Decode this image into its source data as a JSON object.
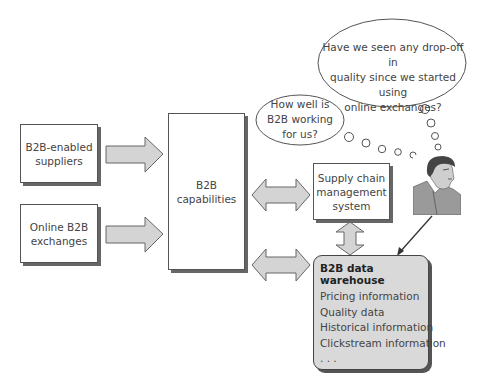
{
  "diagram": {
    "sources": [
      {
        "label": "B2B-enabled\nsuppliers"
      },
      {
        "label": "Online B2B\nexchanges"
      }
    ],
    "capabilities": {
      "label": "B2B capabilities"
    },
    "supply_chain": {
      "label": "Supply chain\nmanagement\nsystem"
    },
    "warehouse": {
      "title": "B2B data warehouse",
      "items": [
        "Pricing information",
        "Quality data",
        "Historical information",
        "Clickstream information",
        ". . ."
      ]
    },
    "thought_small": {
      "text": "How well is\nB2B working\nfor us?"
    },
    "thought_large": {
      "text": "Have we seen any drop-off in\nquality since we started using\nonline exchanges?"
    },
    "person": {
      "icon": "manager-portrait-icon"
    },
    "colors": {
      "arrow_fill": "#d4d4d4",
      "arrow_stroke": "#666666",
      "warehouse_fill": "#d9d9d9",
      "box_border": "#555555"
    }
  }
}
